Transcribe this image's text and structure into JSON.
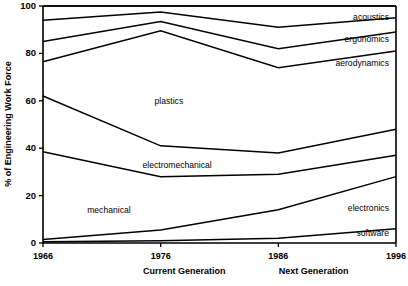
{
  "chart_data": {
    "type": "area",
    "title": "",
    "xlabel": "",
    "ylabel": "% of Engineering Work Force",
    "ylim": [
      0,
      100
    ],
    "yticks": [
      0,
      20,
      40,
      60,
      80,
      100
    ],
    "ytick_labels": [
      "0",
      "20",
      "40",
      "60",
      "80",
      "100"
    ],
    "x": [
      1966,
      1976,
      1986,
      1996
    ],
    "xtick_labels": [
      "1966",
      "1976",
      "1986",
      "1996"
    ],
    "grid": false,
    "legend_position": "inline-labels",
    "stacking": "cumulative-top-boundaries",
    "annotations": [
      {
        "text": "Current Generation",
        "x": 1978
      },
      {
        "text": "Next Generation",
        "x": 1989
      }
    ],
    "series": [
      {
        "name": "software",
        "values": [
          0.5,
          1.0,
          2.0,
          6.0
        ],
        "label": "software",
        "label_x": 1995.4,
        "label_y": 3.0
      },
      {
        "name": "electronics",
        "values": [
          1.0,
          4.5,
          12.0,
          22.0
        ],
        "label": "electronics",
        "label_x": 1995.4,
        "label_y": 13.5
      },
      {
        "name": "mechanical",
        "values": [
          37.0,
          22.5,
          15.0,
          9.0
        ],
        "label": "mechanical",
        "label_x": 1971.6,
        "label_y": 12.5
      },
      {
        "name": "electromechanical",
        "values": [
          23.5,
          13.0,
          9.0,
          11.0
        ],
        "label": "electromechanical",
        "label_x": 1977.4,
        "label_y": 31.5
      },
      {
        "name": "plastics",
        "values": [
          14.5,
          48.5,
          36.0,
          33.0
        ],
        "label": "plastics",
        "label_x": 1976.7,
        "label_y": 58.5
      },
      {
        "name": "aerodynamics",
        "values": [
          8.5,
          4.0,
          8.0,
          8.0
        ],
        "label": "aerodynamics",
        "label_x": 1995.4,
        "label_y": 74.5
      },
      {
        "name": "ergonomics",
        "values": [
          9.0,
          4.0,
          9.0,
          6.0
        ],
        "label": "ergonomics",
        "label_x": 1995.4,
        "label_y": 85.0
      },
      {
        "name": "acoustics",
        "values": [
          6.0,
          2.5,
          9.0,
          5.0
        ],
        "label": "acoustics",
        "label_x": 1995.4,
        "label_y": 94.0
      }
    ],
    "cumulative_boundaries": [
      {
        "name": "software-top",
        "values": [
          0.5,
          1.0,
          2.0,
          6.0
        ]
      },
      {
        "name": "electronics-top",
        "values": [
          1.5,
          5.5,
          14.0,
          28.0
        ]
      },
      {
        "name": "mechanical-top",
        "values": [
          38.5,
          28.0,
          29.0,
          37.0
        ]
      },
      {
        "name": "electromechanical-top",
        "values": [
          62.0,
          41.0,
          38.0,
          48.0
        ]
      },
      {
        "name": "plastics-top",
        "values": [
          76.5,
          89.5,
          74.0,
          81.0
        ]
      },
      {
        "name": "aerodynamics-top",
        "values": [
          85.0,
          93.5,
          82.0,
          89.0
        ]
      },
      {
        "name": "ergonomics-top",
        "values": [
          94.0,
          97.5,
          91.0,
          95.0
        ]
      },
      {
        "name": "acoustics-top",
        "values": [
          100.0,
          100.0,
          100.0,
          100.0
        ]
      }
    ]
  }
}
